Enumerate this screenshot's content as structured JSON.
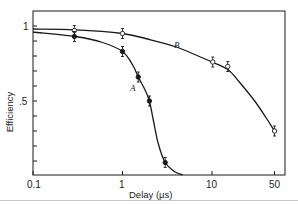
{
  "chart_data": {
    "type": "line",
    "title": "",
    "xlabel": "Delay (μs)",
    "ylabel": "Efficiency",
    "xscale": "log",
    "xlim": [
      0.1,
      60
    ],
    "ylim": [
      0,
      1.1
    ],
    "grid": false,
    "legend": "none (inline curve labels A and B)",
    "x_ticks": [
      {
        "value": 0.1,
        "label": "0.1"
      },
      {
        "value": 1,
        "label": "1"
      },
      {
        "value": 10,
        "label": "10"
      },
      {
        "value": 50,
        "label": "50"
      }
    ],
    "y_ticks": [
      {
        "value": 1.0,
        "label": "1"
      },
      {
        "value": 0.5,
        "label": ".5"
      }
    ],
    "y_minor_ticks": [
      0.1,
      0.2,
      0.3,
      0.4,
      0.6,
      0.7,
      0.8,
      0.9
    ],
    "series": [
      {
        "name": "B",
        "marker": "open-circle",
        "error_bars": true,
        "points": [
          {
            "x": 0.29,
            "y": 0.97
          },
          {
            "x": 1.0,
            "y": 0.95
          },
          {
            "x": 10.2,
            "y": 0.76
          },
          {
            "x": 15,
            "y": 0.73
          },
          {
            "x": 50,
            "y": 0.3
          }
        ],
        "curve": [
          [
            0.1,
            0.98
          ],
          [
            0.3,
            0.975
          ],
          [
            1,
            0.95
          ],
          [
            2,
            0.91
          ],
          [
            4,
            0.86
          ],
          [
            7,
            0.8
          ],
          [
            10,
            0.76
          ],
          [
            15,
            0.71
          ],
          [
            20,
            0.63
          ],
          [
            30,
            0.5
          ],
          [
            40,
            0.39
          ],
          [
            50,
            0.3
          ]
        ],
        "label_position": {
          "x": 4.0,
          "y": 0.86
        }
      },
      {
        "name": "A",
        "marker": "filled-circle",
        "error_bars": true,
        "points": [
          {
            "x": 0.29,
            "y": 0.93
          },
          {
            "x": 1.0,
            "y": 0.83
          },
          {
            "x": 1.5,
            "y": 0.66
          },
          {
            "x": 2.0,
            "y": 0.5
          },
          {
            "x": 3.0,
            "y": 0.09
          }
        ],
        "curve": [
          [
            0.1,
            0.96
          ],
          [
            0.3,
            0.93
          ],
          [
            0.6,
            0.89
          ],
          [
            1,
            0.83
          ],
          [
            1.3,
            0.74
          ],
          [
            1.5,
            0.66
          ],
          [
            1.8,
            0.57
          ],
          [
            2.0,
            0.5
          ],
          [
            2.2,
            0.38
          ],
          [
            2.5,
            0.22
          ],
          [
            3.0,
            0.09
          ],
          [
            3.8,
            0.03
          ],
          [
            4.7,
            0.0
          ]
        ],
        "label_position": {
          "x": 1.62,
          "y": 0.5
        }
      }
    ]
  },
  "axes": {
    "x_title": "Delay (μs)",
    "y_title": "Efficiency",
    "x_ticks": [
      "0.1",
      "1",
      "10",
      "50"
    ],
    "y_ticks": [
      "1",
      ".5"
    ]
  },
  "curve_labels": {
    "a": "A",
    "b": "B"
  },
  "colors": {
    "ink": "#1a1a1a",
    "background": "#ffffff"
  }
}
